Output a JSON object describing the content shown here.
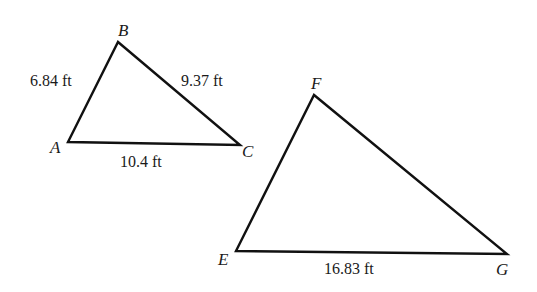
{
  "diagram": {
    "type": "similar-triangles",
    "triangles": [
      {
        "name": "ABC",
        "vertices": {
          "A": {
            "label": "A",
            "x": 68,
            "y": 142
          },
          "B": {
            "label": "B",
            "x": 118,
            "y": 42
          },
          "C": {
            "label": "C",
            "x": 240,
            "y": 145
          }
        },
        "sides": {
          "AB": "6.84 ft",
          "BC": "9.37 ft",
          "AC": "10.4 ft"
        }
      },
      {
        "name": "EFG",
        "vertices": {
          "E": {
            "label": "E",
            "x": 236,
            "y": 251
          },
          "F": {
            "label": "F",
            "x": 314,
            "y": 95
          },
          "G": {
            "label": "G",
            "x": 507,
            "y": 254
          }
        },
        "sides": {
          "EG": "16.83 ft"
        }
      }
    ],
    "colors": {
      "line": "#111111",
      "text": "#1a1a1a",
      "background": "#ffffff"
    }
  }
}
